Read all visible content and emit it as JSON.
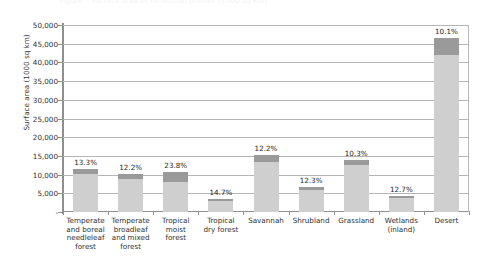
{
  "caption_strip": "Figure – Surface area of terrestrial biomes (1000 sq km)",
  "chart_data": {
    "type": "bar",
    "title": "",
    "subtitle": "",
    "xlabel": "",
    "ylabel": "Surface area (1000 sq km)",
    "ylim": [
      0,
      50000
    ],
    "ytick_step": 5000,
    "ytick_labels": [
      "50,000",
      "45,000",
      "40,000",
      "35,000",
      "30,000",
      "25,000",
      "20,000",
      "15,000",
      "10,000",
      "5,000",
      "-"
    ],
    "ytick_values": [
      50000,
      45000,
      40000,
      35000,
      30000,
      25000,
      20000,
      15000,
      10000,
      5000,
      0
    ],
    "grid": true,
    "grid_axis": "y",
    "legend": "none",
    "stacked": true,
    "categories": [
      "Temperate and boreal needleleaf forest",
      "Temperate broadleaf and mixed forest",
      "Tropical moist forest",
      "Tropical dry forest",
      "Savannah",
      "Shrubland",
      "Grassland",
      "Wetlands (inland)",
      "Desert"
    ],
    "series": [
      {
        "name": "lower-segment",
        "color": "#cfcfcf",
        "values": [
          10050,
          8750,
          8150,
          3000,
          13350,
          5850,
          12550,
          3650,
          42000
        ]
      },
      {
        "name": "upper-segment",
        "color": "#9a9a9a",
        "values": [
          1550,
          1350,
          2550,
          500,
          1850,
          850,
          1450,
          550,
          4500
        ]
      }
    ],
    "totals": [
      11600,
      10100,
      10700,
      3500,
      15200,
      6700,
      14000,
      4200,
      46500
    ],
    "data_labels": [
      "13.3%",
      "12.2%",
      "23.8%",
      "14.7%",
      "12.2%",
      "12.3%",
      "10.3%",
      "12.7%",
      "10.1%"
    ],
    "data_label_meaning": "share of biome area shown as upper (darker) segment"
  },
  "colors": {
    "bar_lower": "#cfcfcf",
    "bar_upper": "#9a9a9a",
    "grid": "#b5b5b5",
    "axis": "#8f8f8f",
    "text": "#2f2f2f",
    "background": "#ffffff"
  }
}
